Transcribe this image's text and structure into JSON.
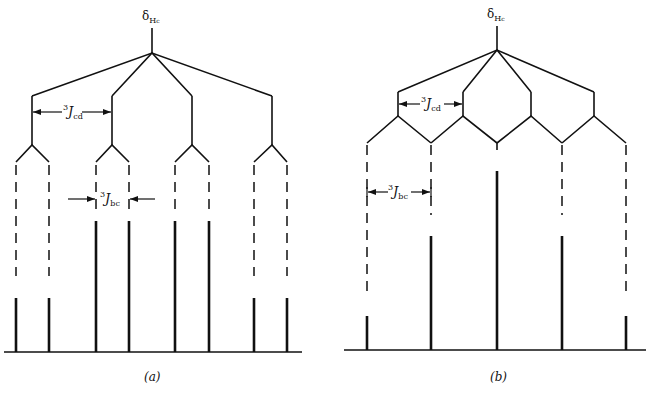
{
  "figure": {
    "panels": [
      {
        "id": "a",
        "caption": "(a)",
        "chemical_shift_label": {
          "symbol": "δ",
          "subscript": "H",
          "subsub": "c"
        },
        "coupling_labels": [
          {
            "name": "3Jcd",
            "sup": "3",
            "J": "J",
            "sub": "cd"
          },
          {
            "name": "3Jbc",
            "sup": "3",
            "J": "J",
            "sub": "bc"
          }
        ],
        "description": "Doublet of quartets: 3Jcd > 3Jbc; 8 lines, intensities 1:1:3:3:3:3:1:1"
      },
      {
        "id": "b",
        "caption": "(b)",
        "chemical_shift_label": {
          "symbol": "δ",
          "subscript": "H",
          "subsub": "c"
        },
        "coupling_labels": [
          {
            "name": "3Jcd",
            "sup": "3",
            "J": "J",
            "sub": "cd"
          },
          {
            "name": "3Jbc",
            "sup": "3",
            "J": "J",
            "sub": "bc"
          }
        ],
        "description": "3Jcd = 3Jbc; lines overlap to give a quintet, intensities 1:4:6:4:1"
      }
    ],
    "lines_a": [
      {
        "x": 16,
        "top": 298
      },
      {
        "x": 49,
        "top": 298
      },
      {
        "x": 96,
        "top": 221
      },
      {
        "x": 129,
        "top": 221
      },
      {
        "x": 175,
        "top": 221
      },
      {
        "x": 209,
        "top": 221
      },
      {
        "x": 254,
        "top": 298
      },
      {
        "x": 287,
        "top": 298
      }
    ],
    "lines_b": [
      {
        "x": 367,
        "top": 316
      },
      {
        "x": 431,
        "top": 236
      },
      {
        "x": 497,
        "top": 171
      },
      {
        "x": 562,
        "top": 236
      },
      {
        "x": 626,
        "top": 316
      }
    ]
  }
}
